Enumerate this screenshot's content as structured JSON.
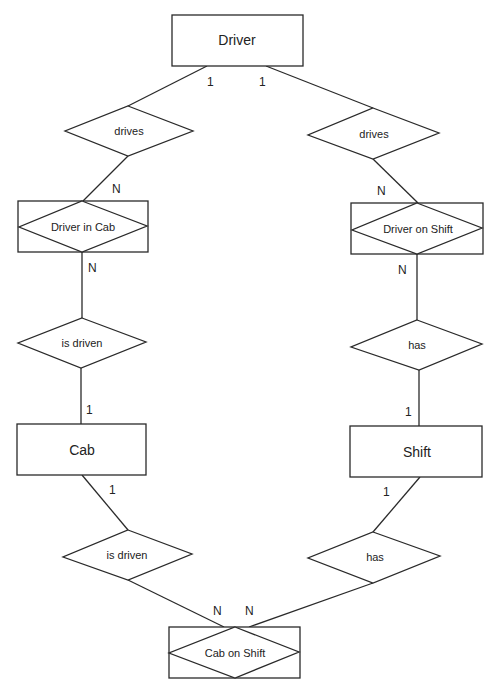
{
  "diagram": {
    "type": "ER diagram",
    "stroke_color": "#2a2a2a",
    "background": "#ffffff",
    "entities": [
      {
        "id": "driver",
        "label": "Driver"
      },
      {
        "id": "cab",
        "label": "Cab"
      },
      {
        "id": "shift",
        "label": "Shift"
      }
    ],
    "associative_entities": [
      {
        "id": "driver_in_cab",
        "label": "Driver in Cab"
      },
      {
        "id": "driver_on_shift",
        "label": "Driver on Shift"
      },
      {
        "id": "cab_on_shift",
        "label": "Cab on Shift"
      }
    ],
    "relationships": [
      {
        "id": "drives_left",
        "label": "drives",
        "from": "Driver",
        "to": "Driver in Cab",
        "card_from": "1",
        "card_to": "N"
      },
      {
        "id": "drives_right",
        "label": "drives",
        "from": "Driver",
        "to": "Driver on Shift",
        "card_from": "1",
        "card_to": "N"
      },
      {
        "id": "is_driven_upper",
        "label": "is driven",
        "from": "Driver in Cab",
        "to": "Cab",
        "card_from": "N",
        "card_to": "1"
      },
      {
        "id": "has_upper",
        "label": "has",
        "from": "Driver on Shift",
        "to": "Shift",
        "card_from": "N",
        "card_to": "1"
      },
      {
        "id": "is_driven_lower",
        "label": "is driven",
        "from": "Cab",
        "to": "Cab on Shift",
        "card_from": "1",
        "card_to": "N"
      },
      {
        "id": "has_lower",
        "label": "has",
        "from": "Shift",
        "to": "Cab on Shift",
        "card_from": "1",
        "card_to": "N"
      }
    ],
    "cardinalities": {
      "driver_left": "1",
      "driver_right": "1",
      "driver_in_cab_top": "N",
      "driver_on_shift_top": "N",
      "driver_in_cab_bottom": "N",
      "driver_on_shift_bottom": "N",
      "cab_top": "1",
      "shift_top": "1",
      "cab_bottom": "1",
      "shift_bottom": "1",
      "cab_on_shift_left": "N",
      "cab_on_shift_right": "N"
    }
  }
}
